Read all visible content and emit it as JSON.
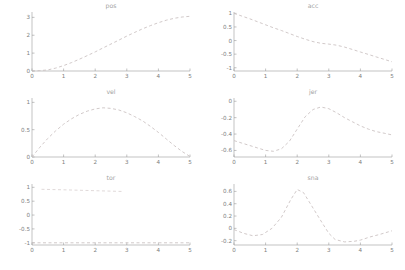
{
  "figure": {
    "background": "#ffffff",
    "axis_color": "#9a9a9a",
    "tick_label_color": "#7d7d7d",
    "title_color": "#a3a3a3",
    "line_color": "#ccc3c3",
    "faint_line_color": "#dcd5d5"
  },
  "chart_data": [
    {
      "type": "line",
      "title": "pos",
      "row": 0,
      "col": 0,
      "grid": false,
      "xlim": [
        0,
        5
      ],
      "ylim": [
        0,
        3.3
      ],
      "xticks": [
        0,
        1,
        2,
        3,
        4,
        5
      ],
      "yticks": [
        0,
        1,
        2,
        3
      ],
      "xlabel": "",
      "ylabel": "",
      "series": [
        {
          "name": "position",
          "x": [
            0,
            0.25,
            0.5,
            0.75,
            1,
            1.25,
            1.5,
            1.75,
            2,
            2.25,
            2.5,
            2.75,
            3,
            3.25,
            3.5,
            3.75,
            4,
            4.25,
            4.5,
            4.75,
            5
          ],
          "y": [
            0,
            0.02,
            0.06,
            0.16,
            0.3,
            0.47,
            0.66,
            0.86,
            1.07,
            1.29,
            1.51,
            1.73,
            1.95,
            2.16,
            2.36,
            2.54,
            2.7,
            2.84,
            2.95,
            3.02,
            3.06
          ]
        }
      ]
    },
    {
      "type": "line",
      "title": "acc",
      "row": 0,
      "col": 1,
      "grid": false,
      "xlim": [
        0,
        5
      ],
      "ylim": [
        -1.12,
        1.05
      ],
      "xticks": [
        0,
        1,
        2,
        3,
        4,
        5
      ],
      "yticks": [
        -1,
        -0.5,
        0,
        0.5,
        1
      ],
      "xlabel": "",
      "ylabel": "",
      "series": [
        {
          "name": "acceleration",
          "x": [
            0,
            0.25,
            0.5,
            0.75,
            1,
            1.25,
            1.5,
            1.75,
            2,
            2.25,
            2.5,
            2.75,
            3,
            3.25,
            3.5,
            3.75,
            4,
            4.25,
            4.5,
            4.75,
            5
          ],
          "y": [
            1,
            0.9,
            0.8,
            0.69,
            0.58,
            0.47,
            0.37,
            0.26,
            0.15,
            0.05,
            -0.04,
            -0.1,
            -0.13,
            -0.17,
            -0.24,
            -0.33,
            -0.42,
            -0.51,
            -0.6,
            -0.69,
            -0.78
          ]
        }
      ]
    },
    {
      "type": "line",
      "title": "vel",
      "row": 1,
      "col": 0,
      "grid": false,
      "xlim": [
        0,
        5
      ],
      "ylim": [
        0,
        1.08
      ],
      "xticks": [
        0,
        1,
        2,
        3,
        4,
        5
      ],
      "yticks": [
        0,
        0.5,
        1
      ],
      "xlabel": "",
      "ylabel": "",
      "series": [
        {
          "name": "velocity",
          "x": [
            0,
            0.25,
            0.5,
            0.75,
            1,
            1.25,
            1.5,
            1.75,
            2,
            2.25,
            2.5,
            2.75,
            3,
            3.25,
            3.5,
            3.75,
            4,
            4.25,
            4.5,
            4.75,
            5
          ],
          "y": [
            0,
            0.18,
            0.34,
            0.48,
            0.6,
            0.7,
            0.78,
            0.84,
            0.88,
            0.9,
            0.89,
            0.86,
            0.81,
            0.74,
            0.66,
            0.56,
            0.45,
            0.33,
            0.21,
            0.1,
            0.01
          ]
        }
      ]
    },
    {
      "type": "line",
      "title": "jer",
      "row": 1,
      "col": 1,
      "grid": false,
      "xlim": [
        0,
        5
      ],
      "ylim": [
        -0.68,
        0.04
      ],
      "xticks": [
        0,
        1,
        2,
        3,
        4,
        5
      ],
      "yticks": [
        -0.6,
        -0.4,
        -0.2,
        0
      ],
      "xlabel": "",
      "ylabel": "",
      "series": [
        {
          "name": "jerk",
          "x": [
            0,
            0.25,
            0.5,
            0.75,
            1,
            1.25,
            1.5,
            1.75,
            2,
            2.25,
            2.5,
            2.75,
            3,
            3.25,
            3.5,
            3.75,
            4,
            4.25,
            4.5,
            4.75,
            5
          ],
          "y": [
            -0.48,
            -0.51,
            -0.54,
            -0.57,
            -0.6,
            -0.61,
            -0.58,
            -0.49,
            -0.34,
            -0.19,
            -0.1,
            -0.07,
            -0.09,
            -0.14,
            -0.2,
            -0.25,
            -0.3,
            -0.34,
            -0.37,
            -0.39,
            -0.41
          ]
        }
      ]
    },
    {
      "type": "line",
      "title": "tor",
      "row": 2,
      "col": 0,
      "grid": false,
      "xlim": [
        0,
        5
      ],
      "ylim": [
        -1.08,
        1.12
      ],
      "xticks": [
        0,
        1,
        2,
        3,
        4,
        5
      ],
      "yticks": [
        -1,
        -0.5,
        0,
        0.5,
        1
      ],
      "xlabel": "",
      "ylabel": "",
      "series": [
        {
          "name": "upper-trace",
          "faint": true,
          "x": [
            0.3,
            1,
            2,
            2.9
          ],
          "y": [
            0.93,
            0.91,
            0.88,
            0.85
          ]
        },
        {
          "name": "torque",
          "x": [
            0,
            5
          ],
          "y": [
            -1,
            -1
          ]
        }
      ]
    },
    {
      "type": "line",
      "title": "sna",
      "row": 2,
      "col": 1,
      "grid": false,
      "xlim": [
        0,
        5
      ],
      "ylim": [
        -0.27,
        0.72
      ],
      "xticks": [
        0,
        1,
        2,
        3,
        4,
        5
      ],
      "yticks": [
        -0.2,
        0,
        0.2,
        0.4,
        0.6
      ],
      "xlabel": "",
      "ylabel": "",
      "series": [
        {
          "name": "snap",
          "x": [
            0,
            0.3,
            0.6,
            0.9,
            1.2,
            1.5,
            1.8,
            2,
            2.2,
            2.5,
            2.8,
            3,
            3.2,
            3.5,
            3.8,
            4,
            4.3,
            4.6,
            5
          ],
          "y": [
            -0.02,
            -0.08,
            -0.12,
            -0.1,
            0,
            0.18,
            0.47,
            0.63,
            0.58,
            0.33,
            0.08,
            -0.08,
            -0.18,
            -0.22,
            -0.21,
            -0.19,
            -0.14,
            -0.1,
            -0.04
          ]
        }
      ]
    }
  ]
}
